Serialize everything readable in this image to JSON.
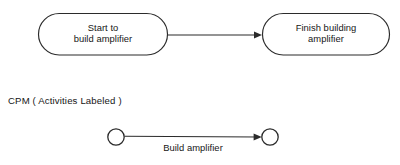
{
  "figure": {
    "background_color": "#ffffff",
    "stroke_color": "#2b2b2b",
    "text_color": "#161616",
    "caption": "CPM ( Activities Labeled )"
  },
  "aon_diagram": {
    "name": "activity-on-node-row",
    "nodes": [
      {
        "id": "start-node",
        "shape": "stadium",
        "line1": "Start to",
        "line2": "build amplifier"
      },
      {
        "id": "finish-node",
        "shape": "stadium",
        "line1": "Finish building",
        "line2": "amplifier"
      }
    ],
    "connector": {
      "id": "start-to-finish-arrow",
      "style": "solid-arrow",
      "label": ""
    }
  },
  "cpm_diagram": {
    "name": "activity-on-arrow-row",
    "events": [
      {
        "id": "event-node-start",
        "shape": "circle",
        "label": ""
      },
      {
        "id": "event-node-finish",
        "shape": "circle",
        "label": ""
      }
    ],
    "activity": {
      "id": "build-amplifier-activity",
      "label": "Build amplifier",
      "style": "solid-arrow"
    }
  }
}
